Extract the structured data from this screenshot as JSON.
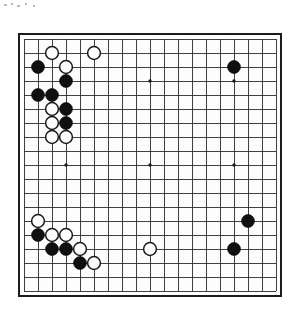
{
  "app": {
    "title": "Go Board Diagram",
    "background_color": "#ffffff"
  },
  "board": {
    "name": "go-board",
    "size": 19,
    "label": "19x19 Go board",
    "origin_x": 24,
    "origin_y": 39,
    "spacing": 14,
    "line_color": "#2b2b2b",
    "border_color": "#1c1c1c",
    "board_color": "#fdfdfd",
    "black_color": "#101010",
    "white_color": "#fdfdfd",
    "stone_radius": 6.4,
    "star_radius": 1.7,
    "star_points": [
      {
        "col": 3,
        "row": 3
      },
      {
        "col": 9,
        "row": 3
      },
      {
        "col": 15,
        "row": 3
      },
      {
        "col": 3,
        "row": 9
      },
      {
        "col": 9,
        "row": 9
      },
      {
        "col": 15,
        "row": 9
      },
      {
        "col": 3,
        "row": 15
      },
      {
        "col": 9,
        "row": 15
      },
      {
        "col": 15,
        "row": 15
      }
    ],
    "stones": [
      {
        "color": "white",
        "col": 2,
        "row": 1,
        "label": "white-stone-C18"
      },
      {
        "color": "white",
        "col": 5,
        "row": 1,
        "label": "white-stone-F18"
      },
      {
        "color": "black",
        "col": 1,
        "row": 2,
        "label": "black-stone-B17"
      },
      {
        "color": "white",
        "col": 3,
        "row": 2,
        "label": "white-stone-D17"
      },
      {
        "color": "black",
        "col": 15,
        "row": 2,
        "label": "black-stone-Q17"
      },
      {
        "color": "black",
        "col": 3,
        "row": 3,
        "label": "black-stone-D16"
      },
      {
        "color": "black",
        "col": 1,
        "row": 4,
        "label": "black-stone-B15"
      },
      {
        "color": "black",
        "col": 2,
        "row": 4,
        "label": "black-stone-C15"
      },
      {
        "color": "white",
        "col": 2,
        "row": 5,
        "label": "white-stone-C14"
      },
      {
        "color": "black",
        "col": 3,
        "row": 5,
        "label": "black-stone-D14"
      },
      {
        "color": "white",
        "col": 2,
        "row": 6,
        "label": "white-stone-C13"
      },
      {
        "color": "black",
        "col": 3,
        "row": 6,
        "label": "black-stone-D13"
      },
      {
        "color": "white",
        "col": 2,
        "row": 7,
        "label": "white-stone-C12"
      },
      {
        "color": "white",
        "col": 3,
        "row": 7,
        "label": "white-stone-D12"
      },
      {
        "color": "white",
        "col": 1,
        "row": 13,
        "label": "white-stone-B6"
      },
      {
        "color": "black",
        "col": 16,
        "row": 13,
        "label": "black-stone-R6"
      },
      {
        "color": "black",
        "col": 1,
        "row": 14,
        "label": "black-stone-B5"
      },
      {
        "color": "white",
        "col": 2,
        "row": 14,
        "label": "white-stone-C5"
      },
      {
        "color": "white",
        "col": 3,
        "row": 14,
        "label": "white-stone-D5"
      },
      {
        "color": "black",
        "col": 2,
        "row": 15,
        "label": "black-stone-C4"
      },
      {
        "color": "black",
        "col": 3,
        "row": 15,
        "label": "black-stone-D4"
      },
      {
        "color": "white",
        "col": 4,
        "row": 15,
        "label": "white-stone-E4"
      },
      {
        "color": "white",
        "col": 9,
        "row": 15,
        "label": "white-stone-K4"
      },
      {
        "color": "black",
        "col": 15,
        "row": 15,
        "label": "black-stone-Q4"
      },
      {
        "color": "black",
        "col": 4,
        "row": 16,
        "label": "black-stone-E3"
      },
      {
        "color": "white",
        "col": 5,
        "row": 16,
        "label": "white-stone-F3"
      }
    ]
  },
  "artifacts": {
    "top_specks_label": "scan-artifacts"
  }
}
